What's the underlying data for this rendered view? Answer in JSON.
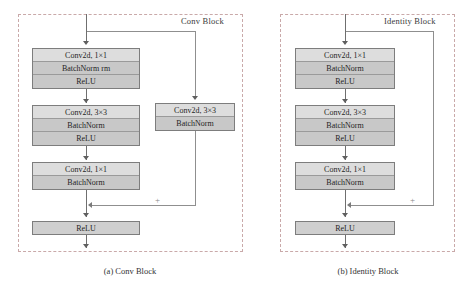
{
  "figure": {
    "panels": [
      {
        "id": "conv-block",
        "title": "Conv Block",
        "caption": "(a) Conv Block",
        "shortcut_type": "convolutional",
        "main_path": [
          {
            "rows": [
              {
                "label": "Conv2d, 1×1",
                "shade": "light"
              },
              {
                "label": "BatchNorm rm",
                "shade": "dark"
              },
              {
                "label": "ReLU",
                "shade": "dark"
              }
            ]
          },
          {
            "rows": [
              {
                "label": "Conv2d, 3×3",
                "shade": "light"
              },
              {
                "label": "BatchNorm",
                "shade": "dark"
              },
              {
                "label": "ReLU",
                "shade": "dark"
              }
            ]
          },
          {
            "rows": [
              {
                "label": "Conv2d, 1×1",
                "shade": "light"
              },
              {
                "label": "BatchNorm",
                "shade": "dark"
              }
            ]
          }
        ],
        "shortcut_branch": {
          "rows": [
            {
              "label": "Conv2d, 3×3",
              "shade": "light"
            },
            {
              "label": "BatchNorm",
              "shade": "dark"
            }
          ]
        },
        "merge_symbol": "+",
        "output_activation": "ReLU"
      },
      {
        "id": "identity-block",
        "title": "Identity Block",
        "caption": "(b) Identity Block",
        "shortcut_type": "identity",
        "main_path": [
          {
            "rows": [
              {
                "label": "Conv2d, 1×1",
                "shade": "light"
              },
              {
                "label": "BatchNorm",
                "shade": "dark"
              },
              {
                "label": "ReLU",
                "shade": "dark"
              }
            ]
          },
          {
            "rows": [
              {
                "label": "Conv2d, 3×3",
                "shade": "light"
              },
              {
                "label": "BatchNorm",
                "shade": "dark"
              },
              {
                "label": "ReLU",
                "shade": "dark"
              }
            ]
          },
          {
            "rows": [
              {
                "label": "Conv2d, 1×1",
                "shade": "light"
              },
              {
                "label": "BatchNorm",
                "shade": "dark"
              }
            ]
          }
        ],
        "shortcut_branch": null,
        "merge_symbol": "+",
        "output_activation": "ReLU"
      }
    ],
    "colors": {
      "panel_border": "#c9a9a9",
      "box_border": "#7d7d7d",
      "row_light": "#dddddd",
      "row_dark": "#c8c8c8",
      "wire": "#8f8f8f",
      "text": "#1f1f1f"
    }
  }
}
